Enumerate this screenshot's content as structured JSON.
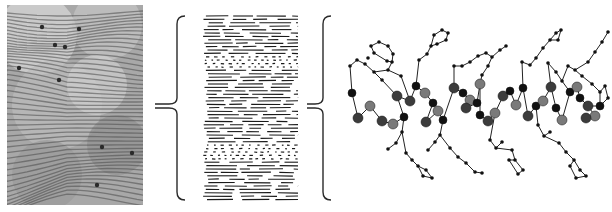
{
  "figure": {
    "panels": [
      {
        "id": "micrograph",
        "description": "grayscale micrograph showing parallel striated fringes"
      },
      {
        "id": "lamellae",
        "description": "schematic of stacked lamellar layers with two disordered bands"
      },
      {
        "id": "molecule",
        "description": "ball-and-stick molecular model of a helical backbone with phenyl side chains"
      }
    ],
    "colors": {
      "background": "#ffffff",
      "ink": "#1a1a1a",
      "bracket": "#2a2a2a",
      "atom_dark": "#111111",
      "atom_mid": "#3c3c3c",
      "atom_gray": "#7a7a7a",
      "micro_base": "#a8a8a8",
      "micro_light": "#d8d8d8",
      "micro_dark": "#4a4a4a"
    },
    "brackets": [
      {
        "id": "bracket-1",
        "x": 27,
        "top": 6,
        "bottom": 190,
        "mid": 96,
        "tail": 5
      },
      {
        "id": "bracket-2",
        "x": 21,
        "top": 6,
        "bottom": 190,
        "mid": 96,
        "tail": 5
      }
    ],
    "lamellae": {
      "width": 98,
      "top": 6,
      "bottom": 192,
      "row_spacing": 3.4,
      "disordered_bands": [
        [
          45,
          60
        ],
        [
          135,
          152
        ]
      ]
    },
    "molecule": {
      "backbone_atoms": [
        [
          22,
          93,
          "dark"
        ],
        [
          28,
          118,
          "mid"
        ],
        [
          40,
          106,
          "gray"
        ],
        [
          52,
          121,
          "mid"
        ],
        [
          63,
          124,
          "gray"
        ],
        [
          67,
          96,
          "mid"
        ],
        [
          74,
          117,
          "dark"
        ],
        [
          80,
          101,
          "mid"
        ],
        [
          86,
          86,
          "dark"
        ],
        [
          95,
          93,
          "gray"
        ],
        [
          103,
          103,
          "dark"
        ],
        [
          96,
          122,
          "mid"
        ],
        [
          108,
          111,
          "gray"
        ],
        [
          113,
          120,
          "dark"
        ],
        [
          124,
          88,
          "mid"
        ],
        [
          133,
          93,
          "dark"
        ],
        [
          140,
          100,
          "gray"
        ],
        [
          147,
          103,
          "dark"
        ],
        [
          136,
          108,
          "mid"
        ],
        [
          150,
          84,
          "gray"
        ],
        [
          150,
          115,
          "dark"
        ],
        [
          158,
          121,
          "mid"
        ],
        [
          165,
          113,
          "gray"
        ],
        [
          173,
          96,
          "mid"
        ],
        [
          180,
          91,
          "dark"
        ],
        [
          186,
          105,
          "gray"
        ],
        [
          193,
          88,
          "dark"
        ],
        [
          198,
          116,
          "mid"
        ],
        [
          206,
          106,
          "dark"
        ],
        [
          213,
          101,
          "gray"
        ],
        [
          221,
          87,
          "mid"
        ],
        [
          226,
          108,
          "dark"
        ],
        [
          232,
          120,
          "gray"
        ],
        [
          240,
          92,
          "dark"
        ],
        [
          247,
          87,
          "gray"
        ],
        [
          250,
          98,
          "dark"
        ],
        [
          258,
          106,
          "mid"
        ],
        [
          265,
          116,
          "gray"
        ],
        [
          256,
          118,
          "mid"
        ],
        [
          270,
          106,
          "dark"
        ]
      ],
      "small_atoms": [
        [
          20,
          66
        ],
        [
          27,
          60
        ],
        [
          35,
          64
        ],
        [
          38,
          58
        ],
        [
          44,
          72
        ],
        [
          52,
          80
        ],
        [
          58,
          70
        ],
        [
          62,
          62
        ],
        [
          71,
          76
        ],
        [
          41,
          46
        ],
        [
          49,
          42
        ],
        [
          58,
          46
        ],
        [
          63,
          54
        ],
        [
          57,
          61
        ],
        [
          44,
          53
        ],
        [
          89,
          60
        ],
        [
          97,
          54
        ],
        [
          101,
          46
        ],
        [
          104,
          35
        ],
        [
          112,
          30
        ],
        [
          118,
          33
        ],
        [
          116,
          40
        ],
        [
          107,
          44
        ],
        [
          58,
          149
        ],
        [
          66,
          143
        ],
        [
          72,
          132
        ],
        [
          76,
          153
        ],
        [
          82,
          160
        ],
        [
          88,
          166
        ],
        [
          96,
          170
        ],
        [
          102,
          178
        ],
        [
          93,
          176
        ],
        [
          98,
          150
        ],
        [
          105,
          142
        ],
        [
          110,
          135
        ],
        [
          120,
          148
        ],
        [
          128,
          157
        ],
        [
          136,
          163
        ],
        [
          145,
          172
        ],
        [
          152,
          173
        ],
        [
          124,
          66
        ],
        [
          132,
          66
        ],
        [
          140,
          62
        ],
        [
          148,
          56
        ],
        [
          156,
          53
        ],
        [
          162,
          57
        ],
        [
          158,
          66
        ],
        [
          152,
          75
        ],
        [
          170,
          50
        ],
        [
          176,
          46
        ],
        [
          160,
          140
        ],
        [
          166,
          148
        ],
        [
          172,
          142
        ],
        [
          182,
          150
        ],
        [
          185,
          160
        ],
        [
          193,
          170
        ],
        [
          188,
          174
        ],
        [
          179,
          160
        ],
        [
          192,
          62
        ],
        [
          200,
          65
        ],
        [
          206,
          58
        ],
        [
          213,
          48
        ],
        [
          220,
          40
        ],
        [
          226,
          33
        ],
        [
          231,
          30
        ],
        [
          228,
          40
        ],
        [
          218,
          63
        ],
        [
          226,
          72
        ],
        [
          232,
          81
        ],
        [
          238,
          66
        ],
        [
          245,
          70
        ],
        [
          252,
          76
        ],
        [
          258,
          62
        ],
        [
          265,
          52
        ],
        [
          272,
          42
        ],
        [
          278,
          32
        ],
        [
          262,
          84
        ],
        [
          270,
          92
        ],
        [
          208,
          125
        ],
        [
          214,
          136
        ],
        [
          220,
          132
        ],
        [
          229,
          143
        ],
        [
          236,
          152
        ],
        [
          244,
          160
        ],
        [
          250,
          170
        ],
        [
          256,
          176
        ],
        [
          246,
          178
        ],
        [
          240,
          166
        ],
        [
          275,
          86
        ],
        [
          278,
          98
        ]
      ],
      "bonds": [
        [
          22,
          93,
          28,
          118
        ],
        [
          28,
          118,
          40,
          106
        ],
        [
          40,
          106,
          52,
          121
        ],
        [
          52,
          121,
          63,
          124
        ],
        [
          63,
          124,
          74,
          117
        ],
        [
          74,
          117,
          67,
          96
        ],
        [
          67,
          96,
          80,
          101
        ],
        [
          80,
          101,
          86,
          86
        ],
        [
          86,
          86,
          95,
          93
        ],
        [
          95,
          93,
          103,
          103
        ],
        [
          103,
          103,
          96,
          122
        ],
        [
          96,
          122,
          108,
          111
        ],
        [
          108,
          111,
          113,
          120
        ],
        [
          113,
          120,
          124,
          88
        ],
        [
          124,
          88,
          133,
          93
        ],
        [
          133,
          93,
          140,
          100
        ],
        [
          140,
          100,
          147,
          103
        ],
        [
          147,
          103,
          136,
          108
        ],
        [
          147,
          103,
          150,
          84
        ],
        [
          150,
          84,
          150,
          115
        ],
        [
          150,
          115,
          158,
          121
        ],
        [
          158,
          121,
          165,
          113
        ],
        [
          165,
          113,
          173,
          96
        ],
        [
          173,
          96,
          180,
          91
        ],
        [
          180,
          91,
          186,
          105
        ],
        [
          186,
          105,
          193,
          88
        ],
        [
          193,
          88,
          198,
          116
        ],
        [
          198,
          116,
          206,
          106
        ],
        [
          206,
          106,
          213,
          101
        ],
        [
          213,
          101,
          221,
          87
        ],
        [
          221,
          87,
          226,
          108
        ],
        [
          226,
          108,
          232,
          120
        ],
        [
          232,
          120,
          240,
          92
        ],
        [
          240,
          92,
          247,
          87
        ],
        [
          247,
          87,
          250,
          98
        ],
        [
          250,
          98,
          258,
          106
        ],
        [
          258,
          106,
          265,
          116
        ],
        [
          265,
          116,
          256,
          118
        ],
        [
          258,
          106,
          270,
          106
        ],
        [
          22,
          93,
          20,
          66
        ],
        [
          20,
          66,
          27,
          60
        ],
        [
          27,
          60,
          35,
          64
        ],
        [
          35,
          64,
          44,
          72
        ],
        [
          44,
          72,
          52,
          80
        ],
        [
          52,
          80,
          67,
          96
        ],
        [
          44,
          72,
          58,
          70
        ],
        [
          58,
          70,
          62,
          62
        ],
        [
          62,
          62,
          57,
          61
        ],
        [
          57,
          61,
          44,
          53
        ],
        [
          44,
          53,
          41,
          46
        ],
        [
          41,
          46,
          49,
          42
        ],
        [
          49,
          42,
          58,
          46
        ],
        [
          58,
          46,
          63,
          54
        ],
        [
          63,
          54,
          62,
          62
        ],
        [
          71,
          76,
          80,
          101
        ],
        [
          71,
          76,
          58,
          70
        ],
        [
          86,
          86,
          89,
          60
        ],
        [
          89,
          60,
          97,
          54
        ],
        [
          97,
          54,
          101,
          46
        ],
        [
          101,
          46,
          104,
          35
        ],
        [
          104,
          35,
          112,
          30
        ],
        [
          112,
          30,
          118,
          33
        ],
        [
          118,
          33,
          116,
          40
        ],
        [
          116,
          40,
          107,
          44
        ],
        [
          107,
          44,
          101,
          46
        ],
        [
          74,
          117,
          72,
          132
        ],
        [
          72,
          132,
          66,
          143
        ],
        [
          66,
          143,
          58,
          149
        ],
        [
          72,
          132,
          76,
          153
        ],
        [
          76,
          153,
          82,
          160
        ],
        [
          82,
          160,
          88,
          166
        ],
        [
          88,
          166,
          96,
          170
        ],
        [
          96,
          170,
          102,
          178
        ],
        [
          102,
          178,
          93,
          176
        ],
        [
          93,
          176,
          88,
          166
        ],
        [
          113,
          120,
          110,
          135
        ],
        [
          110,
          135,
          105,
          142
        ],
        [
          105,
          142,
          98,
          150
        ],
        [
          110,
          135,
          120,
          148
        ],
        [
          120,
          148,
          128,
          157
        ],
        [
          128,
          157,
          136,
          163
        ],
        [
          136,
          163,
          145,
          172
        ],
        [
          145,
          172,
          152,
          173
        ],
        [
          124,
          88,
          124,
          66
        ],
        [
          124,
          66,
          132,
          66
        ],
        [
          132,
          66,
          140,
          62
        ],
        [
          140,
          62,
          148,
          56
        ],
        [
          148,
          56,
          156,
          53
        ],
        [
          156,
          53,
          162,
          57
        ],
        [
          162,
          57,
          158,
          66
        ],
        [
          158,
          66,
          152,
          75
        ],
        [
          152,
          75,
          150,
          84
        ],
        [
          162,
          57,
          170,
          50
        ],
        [
          170,
          50,
          176,
          46
        ],
        [
          165,
          113,
          160,
          140
        ],
        [
          160,
          140,
          166,
          148
        ],
        [
          166,
          148,
          172,
          142
        ],
        [
          166,
          148,
          182,
          150
        ],
        [
          182,
          150,
          185,
          160
        ],
        [
          185,
          160,
          193,
          170
        ],
        [
          193,
          170,
          188,
          174
        ],
        [
          188,
          174,
          179,
          160
        ],
        [
          179,
          160,
          185,
          160
        ],
        [
          193,
          88,
          192,
          62
        ],
        [
          192,
          62,
          200,
          65
        ],
        [
          200,
          65,
          206,
          58
        ],
        [
          206,
          58,
          213,
          48
        ],
        [
          213,
          48,
          220,
          40
        ],
        [
          220,
          40,
          226,
          33
        ],
        [
          226,
          33,
          231,
          30
        ],
        [
          231,
          30,
          228,
          40
        ],
        [
          228,
          40,
          220,
          40
        ],
        [
          221,
          87,
          218,
          63
        ],
        [
          218,
          63,
          226,
          72
        ],
        [
          226,
          72,
          232,
          81
        ],
        [
          232,
          81,
          240,
          92
        ],
        [
          232,
          81,
          238,
          66
        ],
        [
          238,
          66,
          245,
          70
        ],
        [
          245,
          70,
          252,
          76
        ],
        [
          252,
          76,
          262,
          84
        ],
        [
          262,
          84,
          270,
          92
        ],
        [
          270,
          92,
          270,
          106
        ],
        [
          245,
          70,
          258,
          62
        ],
        [
          258,
          62,
          265,
          52
        ],
        [
          265,
          52,
          272,
          42
        ],
        [
          272,
          42,
          278,
          32
        ],
        [
          206,
          106,
          208,
          125
        ],
        [
          208,
          125,
          214,
          136
        ],
        [
          214,
          136,
          220,
          132
        ],
        [
          214,
          136,
          229,
          143
        ],
        [
          229,
          143,
          236,
          152
        ],
        [
          236,
          152,
          244,
          160
        ],
        [
          244,
          160,
          250,
          170
        ],
        [
          250,
          170,
          256,
          176
        ],
        [
          256,
          176,
          246,
          178
        ],
        [
          246,
          178,
          240,
          166
        ],
        [
          240,
          166,
          244,
          160
        ],
        [
          270,
          92,
          275,
          86
        ],
        [
          275,
          86,
          278,
          98
        ],
        [
          278,
          98,
          270,
          106
        ]
      ]
    }
  }
}
